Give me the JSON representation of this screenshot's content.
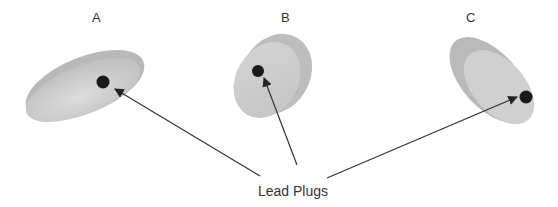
{
  "diagram": {
    "objects": [
      {
        "id": "A",
        "label": "A"
      },
      {
        "id": "B",
        "label": "B"
      },
      {
        "id": "C",
        "label": "C"
      }
    ],
    "callout_label": "Lead Plugs",
    "colors": {
      "body": "#c8c8c8",
      "body_light": "#d9d9d9",
      "plug": "#1a1a1a",
      "arrow": "#333333"
    }
  }
}
